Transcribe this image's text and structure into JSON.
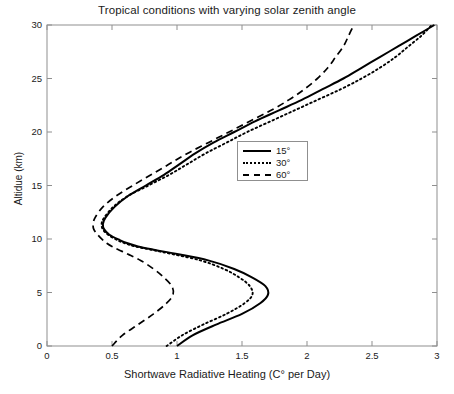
{
  "chart_data": {
    "type": "line",
    "title": "Tropical conditions with varying solar zenith angle",
    "xlabel": "Shortwave Radiative Heating (C° per Day)",
    "ylabel": "Altidue (km)",
    "xlim": [
      0,
      3
    ],
    "ylim": [
      0,
      30
    ],
    "xticks": [
      "0",
      "0.5",
      "1",
      "1.5",
      "2",
      "2.5",
      "3"
    ],
    "xtick_values": [
      0,
      0.5,
      1,
      1.5,
      2,
      2.5,
      3
    ],
    "yticks": [
      "0",
      "5",
      "10",
      "15",
      "20",
      "25",
      "30"
    ],
    "ytick_values": [
      0,
      5,
      10,
      15,
      20,
      25,
      30
    ],
    "grid": false,
    "legend_position": "upper center-right",
    "orientation": "x = heating rate, y = altitude",
    "series": [
      {
        "name": "15°",
        "style": "solid",
        "color": "#000000",
        "x": [
          1.0,
          1.12,
          1.3,
          1.5,
          1.64,
          1.7,
          1.68,
          1.58,
          1.44,
          1.24,
          1.0,
          0.82,
          0.7,
          0.62,
          0.56,
          0.48,
          0.44,
          0.43,
          0.45,
          0.52,
          0.62,
          0.76,
          0.9,
          1.02,
          1.14,
          1.28,
          1.44,
          1.6,
          1.78,
          1.96,
          2.12,
          2.28,
          2.42,
          2.56,
          2.7,
          2.84,
          2.98
        ],
        "y": [
          0.0,
          1.0,
          2.0,
          3.0,
          4.0,
          4.8,
          5.6,
          6.4,
          7.2,
          8.0,
          8.6,
          9.0,
          9.3,
          9.6,
          9.9,
          10.4,
          10.9,
          11.4,
          12.0,
          13.0,
          14.0,
          15.0,
          16.0,
          17.0,
          18.0,
          19.0,
          20.0,
          21.0,
          22.0,
          23.0,
          24.0,
          25.0,
          26.0,
          27.0,
          28.0,
          29.0,
          30.0
        ]
      },
      {
        "name": "30°",
        "style": "dotted",
        "color": "#000000",
        "x": [
          0.92,
          1.04,
          1.2,
          1.38,
          1.52,
          1.58,
          1.56,
          1.48,
          1.36,
          1.18,
          0.96,
          0.8,
          0.68,
          0.6,
          0.54,
          0.47,
          0.43,
          0.42,
          0.44,
          0.51,
          0.62,
          0.78,
          0.94,
          1.08,
          1.22,
          1.38,
          1.54,
          1.72,
          1.9,
          2.08,
          2.26,
          2.42,
          2.56,
          2.68,
          2.78,
          2.88,
          2.96
        ],
        "y": [
          0.0,
          1.0,
          2.0,
          3.0,
          4.0,
          4.8,
          5.6,
          6.4,
          7.2,
          8.0,
          8.6,
          9.0,
          9.3,
          9.6,
          9.9,
          10.4,
          10.9,
          11.4,
          12.0,
          13.0,
          14.0,
          15.0,
          16.0,
          17.0,
          18.0,
          19.0,
          20.0,
          21.0,
          22.0,
          23.0,
          24.0,
          25.0,
          26.0,
          27.0,
          28.0,
          29.0,
          30.0
        ]
      },
      {
        "name": "60°",
        "style": "dashed",
        "color": "#000000",
        "x": [
          0.5,
          0.58,
          0.7,
          0.82,
          0.92,
          0.97,
          0.96,
          0.9,
          0.82,
          0.72,
          0.62,
          0.55,
          0.5,
          0.46,
          0.43,
          0.39,
          0.36,
          0.355,
          0.37,
          0.43,
          0.53,
          0.66,
          0.8,
          0.94,
          1.08,
          1.24,
          1.4,
          1.56,
          1.72,
          1.86,
          1.98,
          2.08,
          2.16,
          2.22,
          2.28,
          2.32,
          2.36
        ],
        "y": [
          0.0,
          1.0,
          2.0,
          3.0,
          4.0,
          4.8,
          5.6,
          6.4,
          7.2,
          8.0,
          8.6,
          9.0,
          9.3,
          9.6,
          9.9,
          10.4,
          10.9,
          11.4,
          12.0,
          13.0,
          14.0,
          15.0,
          16.0,
          17.0,
          18.0,
          19.0,
          20.0,
          21.0,
          22.0,
          23.0,
          24.0,
          25.0,
          26.0,
          27.0,
          28.0,
          29.0,
          30.0
        ]
      }
    ],
    "legend": [
      {
        "label": "15°",
        "style": "solid"
      },
      {
        "label": "30°",
        "style": "dotted"
      },
      {
        "label": "60°",
        "style": "dashed"
      }
    ],
    "annotations": [
      "All curves show a local maximum near 5 km altitude",
      "All curves show a minimum near 11 km altitude",
      "Heating increases monotonically above ~12 km"
    ]
  },
  "axis_frame_color": "#8f8f8f",
  "line_color": "#000000"
}
